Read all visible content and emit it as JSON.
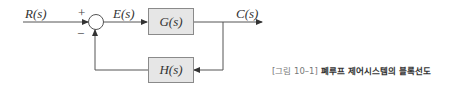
{
  "diagram": {
    "type": "feedback-control-block-diagram",
    "signals": {
      "input": "R(s)",
      "error": "E(s)",
      "output": "C(s)"
    },
    "summing_junction": {
      "plus_sign": "+",
      "minus_sign": "−"
    },
    "blocks": {
      "forward": "G(s)",
      "feedback": "H(s)"
    },
    "colors": {
      "line": "#555555",
      "block_fill": "#e6e6e6",
      "block_border": "#8a8a8a"
    }
  },
  "caption": {
    "figure_number": "[그림 10–1]",
    "title": "폐루프 제어시스템의 블록선도"
  }
}
